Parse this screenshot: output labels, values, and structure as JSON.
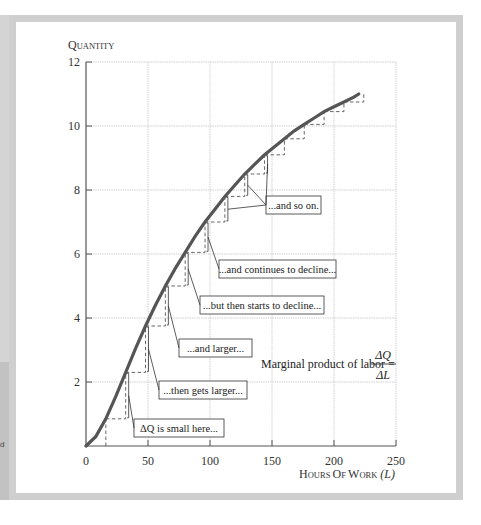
{
  "chart_data": {
    "type": "line",
    "title": "",
    "xlabel": "Hours of work (L)",
    "ylabel": "Quantity",
    "xlim": [
      0,
      250
    ],
    "ylim": [
      0,
      12
    ],
    "x_ticks": [
      0,
      50,
      100,
      150,
      200,
      250
    ],
    "y_ticks": [
      0,
      2,
      4,
      6,
      8,
      10,
      12
    ],
    "grid": true,
    "legend": "none",
    "series": [
      {
        "name": "Production function",
        "x": [
          0,
          8,
          16,
          24,
          32,
          40,
          48,
          56,
          64,
          72,
          80,
          88,
          96,
          104,
          112,
          120,
          128,
          136,
          144,
          152,
          160,
          168,
          176,
          184,
          192,
          200,
          208,
          216,
          220
        ],
        "y": [
          0,
          0.3,
          0.85,
          1.55,
          2.3,
          3.05,
          3.75,
          4.4,
          5.0,
          5.55,
          6.05,
          6.55,
          7.0,
          7.4,
          7.8,
          8.15,
          8.5,
          8.8,
          9.1,
          9.35,
          9.6,
          9.85,
          10.05,
          10.25,
          10.45,
          10.6,
          10.75,
          10.9,
          11.0
        ]
      }
    ],
    "steps": {
      "dL": 16,
      "L": [
        16,
        32,
        48,
        64,
        80,
        96,
        112,
        128,
        144,
        160,
        176,
        192,
        208
      ]
    },
    "annotations": [
      {
        "text": "ΔQ is small here...",
        "target_L": 16
      },
      {
        "text": "...then gets larger...",
        "target_L": 32
      },
      {
        "text": "...and larger...",
        "target_L": 48
      },
      {
        "text": "...but then starts to decline...",
        "target_L": 64
      },
      {
        "text": "...and continues to decline...",
        "target_L": 80
      },
      {
        "text": "...and so on.",
        "target_L": [
          96,
          112,
          128
        ]
      }
    ],
    "formula": {
      "label": "Marginal product of labor =",
      "numerator": "ΔQ",
      "denominator": "ΔL"
    }
  },
  "labels": {
    "y_axis_title": "Quantity",
    "x_axis_title_main": "Hours of work",
    "x_axis_title_var": "(L)",
    "left_fragment": "d"
  },
  "colors": {
    "curve": "#555555",
    "grid": "#d0d0d0",
    "frame": "#cfcfcf",
    "steps": "#666666"
  }
}
